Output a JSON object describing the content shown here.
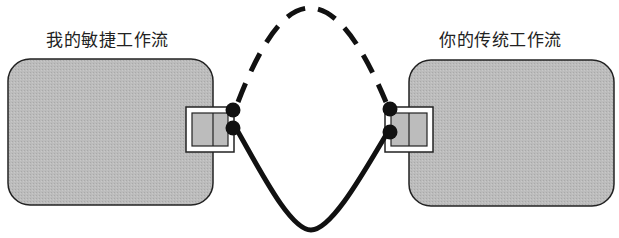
{
  "diagram": {
    "left_workflow": {
      "label": "我的敏捷工作流",
      "fill": "#b9b9b9"
    },
    "right_workflow": {
      "label": "你的传统工作流",
      "fill": "#b9b9b9"
    },
    "connections": [
      {
        "name": "dashed-upper-link",
        "style": "dashed"
      },
      {
        "name": "solid-lower-link",
        "style": "solid"
      }
    ],
    "colors": {
      "stroke": "#111111",
      "box_fill": "#b9b9b9",
      "background": "#ffffff"
    }
  }
}
